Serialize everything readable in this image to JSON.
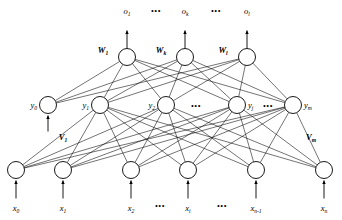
{
  "diagram": {
    "colors": {
      "stroke": "#000000",
      "node_fill": "#ffffff",
      "background": "#ffffff"
    },
    "ellipsis": "•••"
  },
  "output_layer": {
    "nodes": [
      {
        "id": "o1",
        "label": "o",
        "sub": "1",
        "cx": 127,
        "cy": 57
      },
      {
        "id": "ok",
        "label": "o",
        "sub": "k",
        "cx": 185,
        "cy": 57
      },
      {
        "id": "ol",
        "label": "o",
        "sub": "l",
        "cx": 247,
        "cy": 57
      }
    ],
    "signal_labels": [
      {
        "label": "o",
        "sub": "1",
        "x": 127,
        "y": 14
      },
      {
        "label": "o",
        "sub": "k",
        "x": 185,
        "y": 14
      },
      {
        "label": "o",
        "sub": "l",
        "x": 247,
        "y": 14
      }
    ],
    "weight_labels": [
      {
        "label": "W",
        "sub": "1",
        "x": 103,
        "y": 53
      },
      {
        "label": "W",
        "sub": "k",
        "x": 161,
        "y": 53
      },
      {
        "label": "W",
        "sub": "l",
        "x": 223,
        "y": 53
      }
    ],
    "ellipses": [
      {
        "x": 156,
        "y": 14
      },
      {
        "x": 216,
        "y": 14
      }
    ]
  },
  "hidden_layer": {
    "nodes": [
      {
        "id": "y0",
        "label": "y",
        "sub": "0",
        "cx": 48,
        "cy": 105,
        "label_side": "left",
        "bias": true
      },
      {
        "id": "y1",
        "label": "y",
        "sub": "1",
        "cx": 100,
        "cy": 105,
        "label_side": "left",
        "bias": false
      },
      {
        "id": "y2",
        "label": "y",
        "sub": "2",
        "cx": 166,
        "cy": 105,
        "label_side": "left",
        "bias": false
      },
      {
        "id": "yj",
        "label": "y",
        "sub": "j",
        "cx": 237,
        "cy": 105,
        "label_side": "right",
        "bias": false
      },
      {
        "id": "ym",
        "label": "y",
        "sub": "m",
        "cx": 293,
        "cy": 105,
        "label_side": "right",
        "bias": false
      }
    ],
    "weight_labels": [
      {
        "label": "V",
        "sub": "1",
        "x": 63,
        "y": 140
      },
      {
        "label": "V",
        "sub": "m",
        "x": 311,
        "y": 140
      }
    ],
    "ellipses": [
      {
        "x": 196,
        "y": 109
      },
      {
        "x": 268,
        "y": 109
      }
    ]
  },
  "input_layer": {
    "nodes": [
      {
        "id": "x0",
        "label": "x",
        "sub": "0",
        "cx": 16,
        "cy": 170,
        "bias": true
      },
      {
        "id": "x1",
        "label": "x",
        "sub": "1",
        "cx": 63,
        "cy": 170,
        "bias": false
      },
      {
        "id": "x2",
        "label": "x",
        "sub": "2",
        "cx": 131,
        "cy": 170,
        "bias": false
      },
      {
        "id": "xi",
        "label": "x",
        "sub": "i",
        "cx": 188,
        "cy": 170,
        "bias": false
      },
      {
        "id": "xn1",
        "label": "x",
        "sub": "n-1",
        "cx": 256,
        "cy": 170,
        "bias": false
      },
      {
        "id": "xn",
        "label": "x",
        "sub": "n",
        "cx": 324,
        "cy": 170,
        "bias": false
      }
    ],
    "signal_labels": [
      {
        "label": "x",
        "sub": "0",
        "x": 16,
        "y": 211
      },
      {
        "label": "x",
        "sub": "1",
        "x": 63,
        "y": 211
      },
      {
        "label": "x",
        "sub": "2",
        "x": 131,
        "y": 211
      },
      {
        "label": "x",
        "sub": "i",
        "x": 188,
        "y": 211
      },
      {
        "label": "x",
        "sub": "n-1",
        "x": 256,
        "y": 211
      },
      {
        "label": "x",
        "sub": "n",
        "x": 324,
        "y": 211
      }
    ],
    "ellipses": [
      {
        "x": 160,
        "y": 209
      },
      {
        "x": 222,
        "y": 209
      }
    ]
  }
}
